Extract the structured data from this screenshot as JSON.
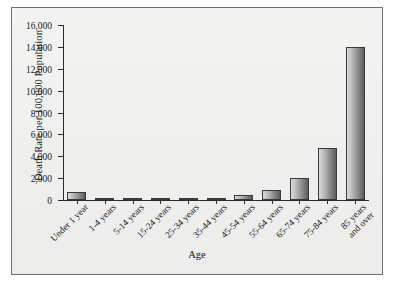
{
  "chart_data": {
    "type": "bar",
    "title": "",
    "xlabel": "Age",
    "ylabel": "Death Rate per 100,000 Population",
    "categories": [
      "Under 1 year",
      "1-4 years",
      "5-14 years",
      "15-24 years",
      "25-34 years",
      "35-44 years",
      "45-54 years",
      "55-64 years",
      "65-74 years",
      "75-84 years",
      "85 years and over"
    ],
    "category_lines": [
      [
        "Under 1 year"
      ],
      [
        "1-4 years"
      ],
      [
        "5-14 years"
      ],
      [
        "15-24 years"
      ],
      [
        "25-34 years"
      ],
      [
        "35-44 years"
      ],
      [
        "45-54 years"
      ],
      [
        "55-64 years"
      ],
      [
        "65-74 years"
      ],
      [
        "75-84 years"
      ],
      [
        "85 years",
        "and over"
      ]
    ],
    "values": [
      700,
      30,
      20,
      80,
      105,
      200,
      430,
      900,
      2000,
      4800,
      14000
    ],
    "ylim": [
      0,
      16000
    ],
    "ytick_values": [
      0,
      2000,
      4000,
      6000,
      8000,
      10000,
      12000,
      14000,
      16000
    ],
    "ytick_labels": [
      "0",
      "2,000",
      "4,000",
      "6,000",
      "8,000",
      "10,000",
      "12,000",
      "14,000",
      "16,000"
    ],
    "grid": false,
    "legend": null,
    "bar_colors": {
      "fill_light": "#d9d9d9",
      "fill_dark": "#5d5d5d",
      "border": "#3a3a3a"
    },
    "axis_color": "#2b2b2b",
    "plot_background": "#efefee",
    "frame_border": "#6e6e6e"
  }
}
